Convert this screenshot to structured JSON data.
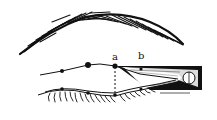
{
  "diagram": {
    "labels": {
      "a": "a",
      "b": "b"
    },
    "colors": {
      "ink": "#111111",
      "background": "#ffffff"
    },
    "elements": [
      {
        "name": "eyebrow",
        "type": "hatched-strokes"
      },
      {
        "name": "upper-eyelid-line",
        "type": "polyline"
      },
      {
        "name": "lower-eyelid-line",
        "type": "polyline"
      },
      {
        "name": "eyelashes",
        "type": "strokes"
      },
      {
        "name": "point-a",
        "type": "dot",
        "label": "a"
      },
      {
        "name": "point-b",
        "type": "dot",
        "label": "b"
      },
      {
        "name": "vertical-guide",
        "type": "dashed-line"
      },
      {
        "name": "eyeliner-wedge",
        "type": "shaded-triangle"
      }
    ]
  }
}
